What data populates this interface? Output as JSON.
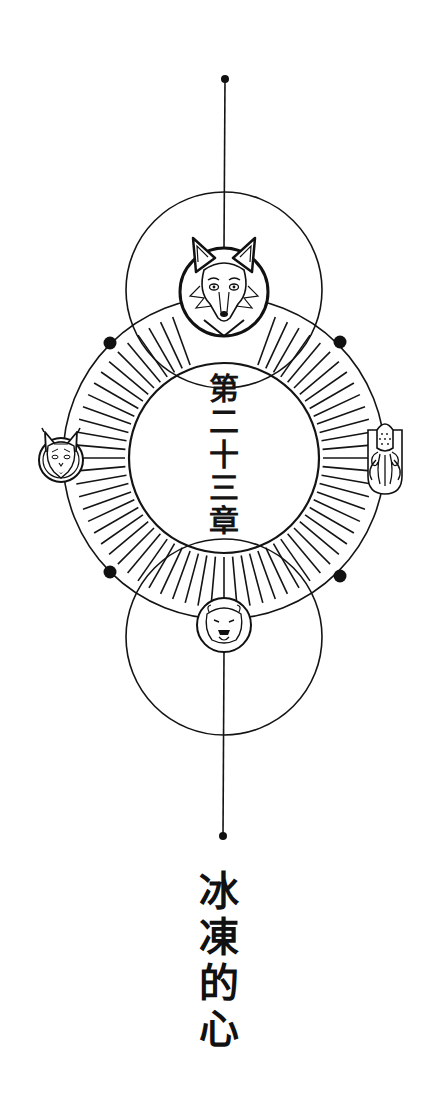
{
  "page": {
    "background": "#ffffff",
    "ink_color": "#141414"
  },
  "emblem": {
    "chapter_chars": [
      "第",
      "二",
      "十",
      "三",
      "章"
    ],
    "chapter_label": "第二十三章",
    "medallions": [
      {
        "animal": "fox",
        "position": "top"
      },
      {
        "animal": "lynx",
        "position": "left"
      },
      {
        "animal": "squid",
        "position": "right"
      },
      {
        "animal": "polar-bear",
        "position": "bottom"
      }
    ]
  },
  "title": {
    "chars": [
      "冰",
      "凍",
      "的",
      "心"
    ],
    "text": "冰凍的心"
  }
}
